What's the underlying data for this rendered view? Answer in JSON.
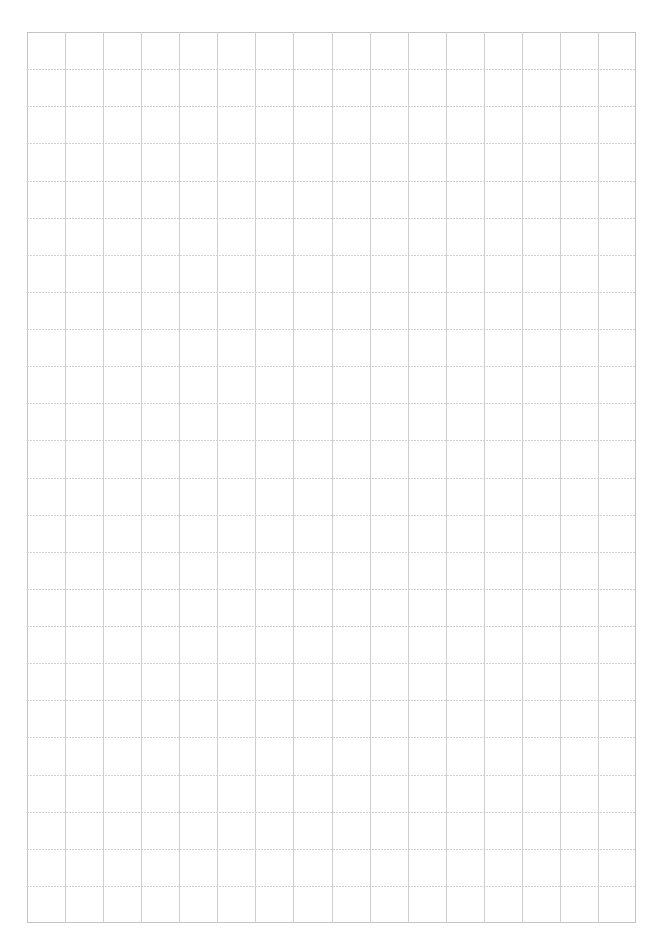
{
  "page": {
    "type": "blank grid paper",
    "background_color": "#ffffff"
  },
  "grid": {
    "columns": 16,
    "rows": 24,
    "left_px": 27,
    "top_px": 32,
    "width_px": 609,
    "height_px": 891,
    "cell_width_px": 38.06,
    "cell_height_px": 37.13,
    "line_color": "#c4c4c4",
    "inner_line_color": "#cfcfcf",
    "line_style": "thin, slightly dotted (scanned)"
  }
}
